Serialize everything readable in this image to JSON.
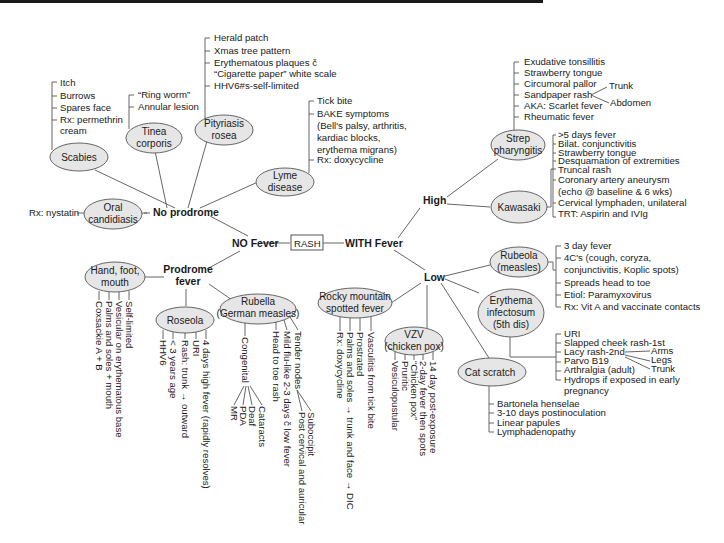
{
  "center": {
    "label": "RASH",
    "left": "NO Fever",
    "right": "WITH Fever"
  },
  "no_fever": {
    "no_prodrome": {
      "label": "No prodrome",
      "scabies": {
        "name": "Scabies",
        "items": [
          "Itch",
          "Burrows",
          "Spares face",
          "Rx: permethrin",
          "cream"
        ]
      },
      "tinea": {
        "name_1": "Tinea",
        "name_2": "corporis",
        "items": [
          "“Ring worm”",
          "Annular lesion"
        ]
      },
      "pityriasis": {
        "name_1": "Pityriasis",
        "name_2": "rosea",
        "items": [
          "Herald patch",
          "Xmas tree pattern",
          "Erythematous plaques č",
          "“Cigarette paper” white scale",
          "HHV6#s-self-limited"
        ]
      },
      "lyme": {
        "name_1": "Lyme",
        "name_2": "disease",
        "items": [
          "Tick bite",
          "BAKE symptoms",
          "(Bell's palsy, arthritis,",
          "kardiac blocks,",
          "erythema migrans)",
          "Rx: doxycycline"
        ]
      },
      "oral": {
        "name_1": "Oral",
        "name_2": "candidiasis",
        "rx": "Rx: nystatin"
      }
    },
    "prodrome": {
      "label_1": "Prodrome",
      "label_2": "fever",
      "hfm": {
        "name_1": "Hand, foot,",
        "name_2": "mouth",
        "items": [
          "Self-limited",
          "Vesicular on erythematous base",
          "Palms and soles + mouth",
          "Coxsackie A + B"
        ]
      },
      "roseola": {
        "name": "Roseola",
        "items": [
          "4 days high fever (rapidly resolves)",
          "URI",
          "Rash: trunk → outward",
          "< 3 years age",
          "HHV6"
        ]
      },
      "rubella": {
        "name_1": "Rubella",
        "name_2": "(German measles)",
        "items": [
          "Tender nodes",
          "Mild flu-like 2-3 days č low fever",
          "Head to toe rash"
        ],
        "tender_sub": [
          "Suboccipit",
          "Post cervical and auricular"
        ],
        "congenital": "Congenital",
        "congenital_sub": [
          "Cataracts",
          "Deaf",
          "PDA",
          "MR"
        ]
      }
    }
  },
  "with_fever": {
    "high": {
      "label": "High",
      "strep": {
        "name_1": "Strep",
        "name_2": "pharyngitis",
        "items": [
          "Exudative tonsillitis",
          "Strawberry tongue",
          "Circumoral pallor",
          "Sandpaper rash",
          "AKA: Scarlet fever",
          "Rheumatic fever"
        ],
        "sandpaper_sub": [
          "Trunk",
          "Abdomen"
        ]
      },
      "kawasaki": {
        "name": "Kawasaki",
        "items": [
          ">5 days fever",
          "Bilat. conjunctivitis",
          "Strawberry tongue",
          "Desquamation of extremities",
          "Truncal rash",
          "Coronary artery aneurysm",
          "(echo @ baseline & 6 wks)",
          "Cervical lymphaden, unilateral",
          "TRT: Aspirin and IVIg"
        ]
      }
    },
    "low": {
      "label": "Low",
      "rubeola": {
        "name_1": "Rubeola",
        "name_2": "(measles)",
        "items": [
          "3 day fever",
          "4C's (cough, coryza,",
          "conjunctivitis, Koplic spots)",
          "Spreads head to toe",
          "Etiol: Paramyxovirus",
          "Rx: Vit A and vaccinate contacts"
        ]
      },
      "erythema": {
        "name_1": "Erythema",
        "name_2": "infectosum",
        "name_3": "(5th dis)",
        "items": [
          "URI",
          "Slapped cheek rash-1st",
          "Lacy rash-2nd",
          "Parvo B19",
          "Arthralgia (adult)",
          "Hydrops if exposed in early",
          "pregnancy"
        ],
        "lacy_sub": [
          "Arms",
          "Legs",
          "Trunk"
        ]
      },
      "cat": {
        "name": "Cat scratch",
        "items": [
          "Bartonela henselae",
          "3-10 days postinoculation",
          "Linear papules",
          "Lymphadenopathy"
        ]
      },
      "vzv": {
        "name_1": "VZV",
        "name_2": "(chicken pox)",
        "items": [
          "14 day post-exposure",
          "2-day fever then spots",
          "“Chicken pox”",
          "Pruritic",
          "Vesiculopustular"
        ]
      },
      "rmsf": {
        "name_1": "Rocky mountain",
        "name_2": "spotted fever",
        "items": [
          "Vasculitis from tick bite",
          "Prostrated",
          "Palms and soles → trunk and face → DIC",
          "Rx: doxycycline"
        ]
      }
    }
  }
}
